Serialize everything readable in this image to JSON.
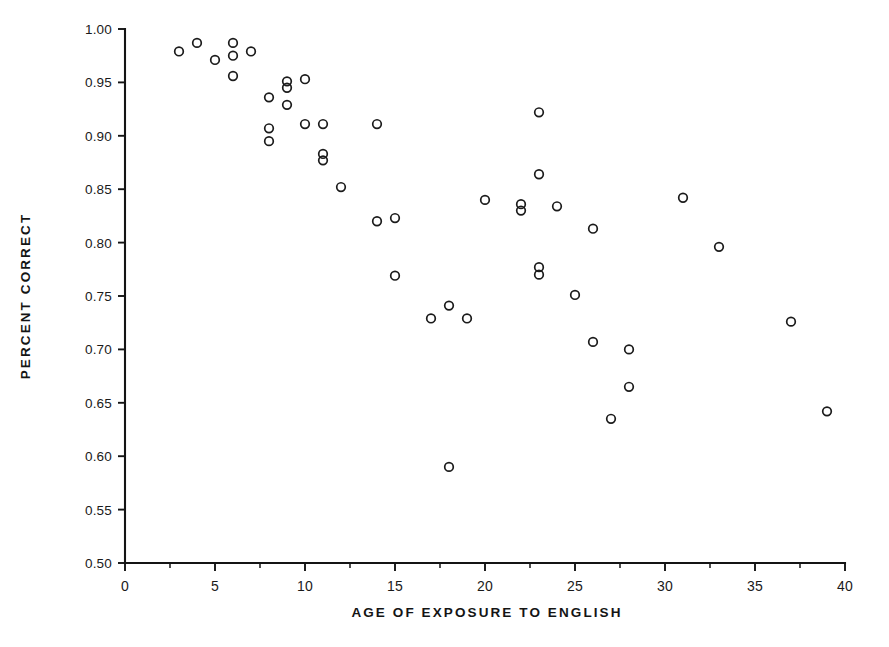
{
  "chart_data": {
    "type": "scatter",
    "title": "",
    "xlabel": "AGE OF EXPOSURE TO ENGLISH",
    "ylabel": "PERCENT CORRECT",
    "xlim": [
      0,
      40
    ],
    "ylim": [
      0.5,
      1.0
    ],
    "grid": false,
    "legend": null,
    "marker_style": "open-circle",
    "marker_color": "#1b1b1b",
    "xticks": [
      0,
      5,
      10,
      15,
      20,
      25,
      30,
      35,
      40
    ],
    "xtick_labels": [
      "0",
      "5",
      "10",
      "15",
      "20",
      "25",
      "30",
      "35",
      "40"
    ],
    "x_minor_tick_interval": 2.5,
    "yticks": [
      0.5,
      0.55,
      0.6,
      0.65,
      0.7,
      0.75,
      0.8,
      0.85,
      0.9,
      0.95,
      1.0
    ],
    "ytick_labels": [
      "0.50",
      "0.55",
      "0.60",
      "0.65",
      "0.70",
      "0.75",
      "0.80",
      "0.85",
      "0.90",
      "0.95",
      "1.00"
    ],
    "n_points": 46,
    "points": [
      {
        "x": 3,
        "y": 0.979
      },
      {
        "x": 4,
        "y": 0.987
      },
      {
        "x": 5,
        "y": 0.971
      },
      {
        "x": 6,
        "y": 0.987
      },
      {
        "x": 6,
        "y": 0.975
      },
      {
        "x": 6,
        "y": 0.956
      },
      {
        "x": 7,
        "y": 0.979
      },
      {
        "x": 8,
        "y": 0.936
      },
      {
        "x": 8,
        "y": 0.907
      },
      {
        "x": 8,
        "y": 0.895
      },
      {
        "x": 9,
        "y": 0.951
      },
      {
        "x": 9,
        "y": 0.945
      },
      {
        "x": 9,
        "y": 0.929
      },
      {
        "x": 10,
        "y": 0.953
      },
      {
        "x": 10,
        "y": 0.911
      },
      {
        "x": 11,
        "y": 0.911
      },
      {
        "x": 11,
        "y": 0.883
      },
      {
        "x": 11,
        "y": 0.877
      },
      {
        "x": 12,
        "y": 0.852
      },
      {
        "x": 14,
        "y": 0.911
      },
      {
        "x": 14,
        "y": 0.82
      },
      {
        "x": 15,
        "y": 0.823
      },
      {
        "x": 15,
        "y": 0.769
      },
      {
        "x": 17,
        "y": 0.729
      },
      {
        "x": 18,
        "y": 0.741
      },
      {
        "x": 18,
        "y": 0.59
      },
      {
        "x": 19,
        "y": 0.729
      },
      {
        "x": 20,
        "y": 0.84
      },
      {
        "x": 22,
        "y": 0.836
      },
      {
        "x": 22,
        "y": 0.83
      },
      {
        "x": 23,
        "y": 0.922
      },
      {
        "x": 23,
        "y": 0.864
      },
      {
        "x": 23,
        "y": 0.777
      },
      {
        "x": 23,
        "y": 0.77
      },
      {
        "x": 24,
        "y": 0.834
      },
      {
        "x": 25,
        "y": 0.751
      },
      {
        "x": 26,
        "y": 0.813
      },
      {
        "x": 26,
        "y": 0.707
      },
      {
        "x": 27,
        "y": 0.635
      },
      {
        "x": 28,
        "y": 0.7
      },
      {
        "x": 28,
        "y": 0.665
      },
      {
        "x": 31,
        "y": 0.842
      },
      {
        "x": 33,
        "y": 0.796
      },
      {
        "x": 37,
        "y": 0.726
      },
      {
        "x": 39,
        "y": 0.642
      }
    ]
  },
  "figure": {
    "background_color": "#ffffff",
    "axis_color": "#141414"
  }
}
